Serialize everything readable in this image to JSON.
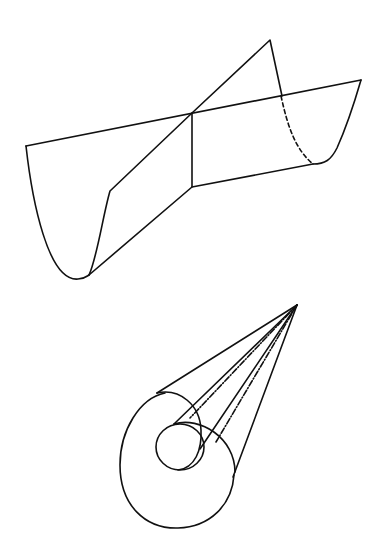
{
  "figure": {
    "width": 379,
    "height": 558,
    "background": "#ffffff",
    "ink": "#111111",
    "stroke_width": 1.6,
    "parts": [
      {
        "name": "saddle-surface",
        "description": "two intersecting parabolic cylinder surfaces"
      },
      {
        "name": "cone-with-circles",
        "description": "cone from apex tangent to circles with dash-dot generators"
      }
    ]
  },
  "saddle": {
    "solid_paths": [
      "M26,146 L361,80",
      "M26,146 C32,200 48,282 78,279 C84,279 86,277 89,275",
      "M89,275 C97,258 103,215 110,191 L192,113 L270,40 L282,96",
      "M89,275 L192,187 L192,113",
      "M192,187 L313,164",
      "M313,164 C325,164 331,160 337,148 C346,128 354,104 361,80"
    ],
    "dashed_path": "M281,96 C288,128 296,150 313,164"
  },
  "cone": {
    "solid_paths": [
      "M297,305 L157,393",
      "M297,305 L233,477",
      "M297,305 L174,424",
      "M297,305 L200,449"
    ],
    "dashdot_paths": [
      "M297,305 L190,418",
      "M297,305 L216,442"
    ],
    "ellipses": [
      {
        "name": "outer-loop-left",
        "path": "M165,393 C140,398 120,430 120,465 C120,505 145,529 178,528 C210,527 232,505 234,475"
      },
      {
        "name": "outer-loop-top",
        "path": "M157,393 C180,388 200,405 201,430 C202,450 195,468 178,470"
      },
      {
        "name": "medium-arc",
        "path": "M174,424 C200,416 235,438 235,472"
      },
      {
        "name": "small-circle",
        "cx": 180,
        "cy": 447,
        "rx": 24,
        "ry": 23
      }
    ]
  }
}
